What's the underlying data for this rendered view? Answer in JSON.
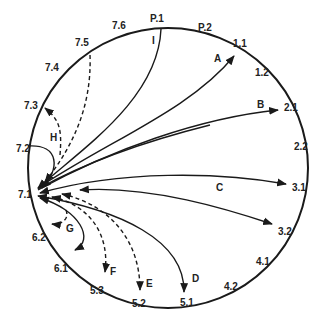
{
  "diagram": {
    "type": "circular-flow",
    "stroke_color": "#1a1a1a",
    "hub_label": "7.1",
    "perimeter_labels": [
      {
        "id": "p1",
        "text": "P.1",
        "x": 158,
        "y": 22
      },
      {
        "id": "p2",
        "text": "P.2",
        "x": 205,
        "y": 31
      },
      {
        "id": "l11",
        "text": "1.1",
        "x": 240,
        "y": 47
      },
      {
        "id": "l12",
        "text": "1.2",
        "x": 262,
        "y": 76
      },
      {
        "id": "l21",
        "text": "2.1",
        "x": 286,
        "y": 110
      },
      {
        "id": "l22",
        "text": "2.2",
        "x": 295,
        "y": 150
      },
      {
        "id": "l31",
        "text": "3.1",
        "x": 293,
        "y": 193
      },
      {
        "id": "l32",
        "text": "3.2",
        "x": 282,
        "y": 235
      },
      {
        "id": "l41",
        "text": "4.1",
        "x": 260,
        "y": 265
      },
      {
        "id": "l42",
        "text": "4.2",
        "x": 226,
        "y": 290
      },
      {
        "id": "l51",
        "text": "5.1",
        "x": 184,
        "y": 305
      },
      {
        "id": "l52",
        "text": "5.2",
        "x": 140,
        "y": 306
      },
      {
        "id": "l53",
        "text": "5.3",
        "x": 97,
        "y": 294
      },
      {
        "id": "l61",
        "text": "6.1",
        "x": 57,
        "y": 272
      },
      {
        "id": "l62",
        "text": "6.2",
        "x": 33,
        "y": 241
      },
      {
        "id": "l71",
        "text": "7.1",
        "x": 17,
        "y": 197
      },
      {
        "id": "l72",
        "text": "7.2",
        "x": 17,
        "y": 152
      },
      {
        "id": "l73",
        "text": "7.3",
        "x": 25,
        "y": 109
      },
      {
        "id": "l74",
        "text": "7.4",
        "x": 48,
        "y": 71
      },
      {
        "id": "l75",
        "text": "7.5",
        "x": 77,
        "y": 46
      },
      {
        "id": "l76",
        "text": "7.6",
        "x": 113,
        "y": 30
      }
    ],
    "flow_labels": [
      {
        "id": "A",
        "text": "A",
        "x": 212,
        "y": 62
      },
      {
        "id": "B",
        "text": "B",
        "x": 259,
        "y": 108
      },
      {
        "id": "C",
        "text": "C",
        "x": 218,
        "y": 191
      },
      {
        "id": "D",
        "text": "D",
        "x": 195,
        "y": 283
      },
      {
        "id": "E",
        "text": "E",
        "x": 148,
        "y": 288
      },
      {
        "id": "F",
        "text": "F",
        "x": 113,
        "y": 276
      },
      {
        "id": "G",
        "text": "G",
        "x": 70,
        "y": 232
      },
      {
        "id": "H",
        "text": "H",
        "x": 53,
        "y": 141
      },
      {
        "id": "I",
        "text": "I",
        "x": 155,
        "y": 44
      }
    ]
  }
}
